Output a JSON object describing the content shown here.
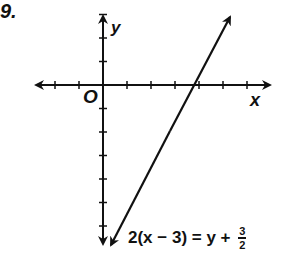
{
  "problem": {
    "number": "9.",
    "equation": {
      "text": "2(x − 3) = y + 3/2",
      "lhs": "2(x − 3) = y + ",
      "frac_num": "3",
      "frac_den": "2"
    }
  },
  "axes": {
    "x_label": "x",
    "y_label": "y",
    "origin_label": "O",
    "unit_px": 24,
    "x_ticks": [
      -2,
      -1,
      1,
      2,
      3,
      4,
      5,
      6
    ],
    "y_ticks": [
      3,
      2,
      1,
      -1,
      -2,
      -3,
      -4,
      -5,
      -6
    ]
  },
  "chart_data": {
    "type": "line",
    "xlabel": "x",
    "ylabel": "y",
    "xlim": [
      -3,
      7
    ],
    "ylim": [
      -6.5,
      3
    ],
    "grid": false,
    "series": [
      {
        "name": "y = 2x − 7.5",
        "x": [
          0.3,
          5.3
        ],
        "y": [
          -6.9,
          3.1
        ]
      }
    ],
    "annotations": [
      "O",
      "2(x − 3) = y + 3/2"
    ],
    "x_intercept": 3.75
  },
  "colors": {
    "ink": "#111111",
    "background": "#ffffff"
  }
}
